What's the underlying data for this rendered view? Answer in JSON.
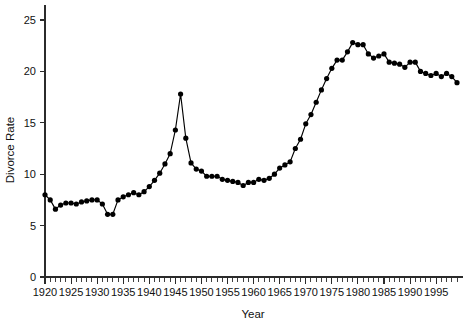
{
  "chart_data": {
    "type": "line",
    "title": "",
    "xlabel": "Year",
    "ylabel": "Divorce Rate",
    "xlim": [
      1920,
      1999
    ],
    "ylim": [
      0,
      26.5
    ],
    "grid": false,
    "legend": "none",
    "markers": "filled-circle",
    "marker_color": "#000000",
    "line_color": "#000000",
    "x_tick_labels": [
      "1920",
      "1925",
      "1930",
      "1935",
      "1940",
      "1945",
      "1950",
      "1955",
      "1960",
      "1965",
      "1970",
      "1975",
      "1980",
      "1985",
      "1990",
      "1995"
    ],
    "x_tick_values": [
      1920,
      1925,
      1930,
      1935,
      1940,
      1945,
      1950,
      1955,
      1960,
      1965,
      1970,
      1975,
      1980,
      1985,
      1990,
      1995
    ],
    "x_minor_tick_step": 1,
    "y_tick_labels": [
      "0",
      "5",
      "10",
      "15",
      "20",
      "25"
    ],
    "y_tick_values": [
      0,
      5,
      10,
      15,
      20,
      25
    ],
    "x": [
      1920,
      1921,
      1922,
      1923,
      1924,
      1925,
      1926,
      1927,
      1928,
      1929,
      1930,
      1931,
      1932,
      1933,
      1934,
      1935,
      1936,
      1937,
      1938,
      1939,
      1940,
      1941,
      1942,
      1943,
      1944,
      1945,
      1946,
      1947,
      1948,
      1949,
      1950,
      1951,
      1952,
      1953,
      1954,
      1955,
      1956,
      1957,
      1958,
      1959,
      1960,
      1961,
      1962,
      1963,
      1964,
      1965,
      1966,
      1967,
      1968,
      1969,
      1970,
      1971,
      1972,
      1973,
      1974,
      1975,
      1976,
      1977,
      1978,
      1979,
      1980,
      1981,
      1982,
      1983,
      1984,
      1985,
      1986,
      1987,
      1988,
      1989,
      1990,
      1991,
      1992,
      1993,
      1994,
      1995,
      1996,
      1997,
      1998,
      1999
    ],
    "y": [
      8.0,
      7.5,
      6.6,
      7.0,
      7.2,
      7.2,
      7.1,
      7.3,
      7.4,
      7.5,
      7.5,
      7.1,
      6.1,
      6.1,
      7.5,
      7.8,
      8.0,
      8.2,
      8.0,
      8.3,
      8.8,
      9.4,
      10.1,
      11.0,
      12.0,
      14.3,
      17.8,
      13.5,
      11.1,
      10.5,
      10.3,
      9.8,
      9.8,
      9.8,
      9.5,
      9.4,
      9.3,
      9.2,
      8.9,
      9.2,
      9.2,
      9.5,
      9.4,
      9.6,
      10.0,
      10.6,
      10.9,
      11.2,
      12.5,
      13.4,
      14.9,
      15.8,
      17.0,
      18.2,
      19.3,
      20.3,
      21.1,
      21.1,
      21.9,
      22.8,
      22.6,
      22.6,
      21.7,
      21.3,
      21.5,
      21.7,
      20.9,
      20.8,
      20.7,
      20.4,
      20.9,
      20.9,
      20.0,
      19.8,
      19.6,
      19.8,
      19.5,
      19.8,
      19.5,
      18.9,
      18.8,
      18.9
    ]
  }
}
